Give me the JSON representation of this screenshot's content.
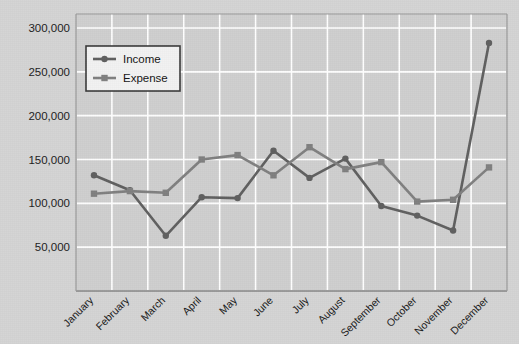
{
  "chart_data": {
    "type": "line",
    "title": "",
    "xlabel": "",
    "ylabel": "",
    "categories": [
      "January",
      "February",
      "March",
      "April",
      "May",
      "June",
      "July",
      "August",
      "September",
      "October",
      "November",
      "December"
    ],
    "series": [
      {
        "name": "Income",
        "marker": "circle",
        "color": "#606060",
        "values": [
          132000,
          115000,
          63000,
          107000,
          106000,
          160000,
          129000,
          151000,
          97000,
          86000,
          69000,
          283000
        ]
      },
      {
        "name": "Expense",
        "marker": "square",
        "color": "#808080",
        "values": [
          111000,
          114000,
          112000,
          150000,
          155000,
          132000,
          164000,
          139000,
          147000,
          102000,
          104000,
          141000
        ]
      }
    ],
    "yticks": [
      50000,
      100000,
      150000,
      200000,
      250000,
      300000
    ],
    "ytick_labels": [
      "50,000",
      "100,000",
      "150,000",
      "200,000",
      "250,000",
      "300,000"
    ],
    "ylim": [
      0,
      310000
    ],
    "grid": true,
    "grid_color": "#ffffff",
    "plot_background": "#cfcfcf",
    "page_background": "#d4d4d4",
    "axis_color": "#9a9a9a",
    "legend": {
      "position": "top-left-inside",
      "background": "#f2f2f2",
      "border_color": "#3a3a3a",
      "entries": [
        {
          "label": "Income",
          "marker": "circle"
        },
        {
          "label": "Expense",
          "marker": "square"
        }
      ]
    }
  }
}
